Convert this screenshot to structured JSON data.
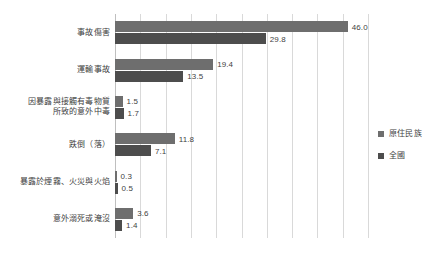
{
  "chart_data": {
    "type": "bar",
    "orientation": "horizontal",
    "title": "",
    "subtitle": "",
    "xlabel": "",
    "ylabel": "",
    "xlim": [
      0,
      50
    ],
    "xticks": [
      0,
      5,
      10,
      15,
      20,
      25,
      30,
      35,
      40,
      45,
      50
    ],
    "xtick_labels": [
      "",
      "",
      "",
      "",
      "",
      "",
      "",
      "",
      "",
      "",
      ""
    ],
    "grid": true,
    "grid_axis": "x",
    "legend_position": "right",
    "categories": [
      "事故傷害",
      "運輸事故",
      "因暴露與接觸有毒物質所致的意外中毒",
      "跌倒（落）",
      "暴露於煙霧、火災與火焰",
      "意外溺死或淹沒"
    ],
    "category_lines": [
      [
        "事故傷害"
      ],
      [
        "運輸事故"
      ],
      [
        "因暴露與接觸有毒物質",
        "所致的意外中毒"
      ],
      [
        "跌倒（落）"
      ],
      [
        "暴露於煙霧、火災與火焰"
      ],
      [
        "意外溺死或淹沒"
      ]
    ],
    "series": [
      {
        "name": "原住民族",
        "color": "#6e6e6e",
        "values": [
          46.0,
          19.4,
          1.5,
          11.8,
          0.3,
          3.6
        ],
        "value_labels": [
          "46.0",
          "19.4",
          "1.5",
          "11.8",
          "0.3",
          "3.6"
        ]
      },
      {
        "name": "全國",
        "color": "#4d4d4d",
        "values": [
          29.8,
          13.5,
          1.7,
          7.1,
          0.5,
          1.4
        ],
        "value_labels": [
          "29.8",
          "13.5",
          "1.7",
          "7.1",
          "0.5",
          "1.4"
        ]
      }
    ]
  },
  "legend": {
    "items": [
      {
        "label": "原住民族",
        "color": "#6e6e6e"
      },
      {
        "label": "全國",
        "color": "#4d4d4d"
      }
    ]
  },
  "colors": {
    "series_1": "#6e6e6e",
    "series_2": "#4d4d4d",
    "gridline": "#d9d9d9",
    "axis": "#bfbfbf",
    "text": "#3f3f3f",
    "background": "#ffffff"
  }
}
